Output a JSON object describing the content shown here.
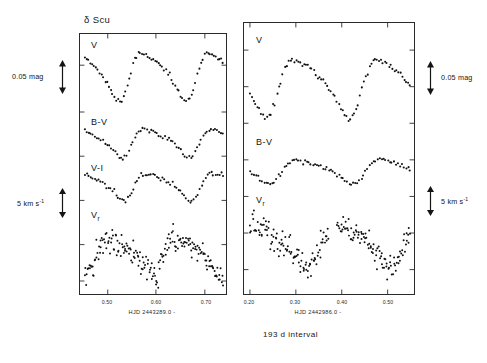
{
  "figure": {
    "star_name": "δ Scu",
    "interval_caption": "193 d  interval",
    "background": "#ffffff",
    "ink": "#141414"
  },
  "scales": {
    "mag_label": "0.05 mag",
    "vel_label_text": "5 km s",
    "vel_label_exponent": "-1",
    "left_mag_bar": {
      "x": 62,
      "y_top": 62,
      "y_bottom": 92
    },
    "left_vel_bar": {
      "x": 62,
      "y_top": 190,
      "y_bottom": 215
    },
    "right_mag_bar": {
      "x": 430,
      "y_top": 63,
      "y_bottom": 93
    },
    "right_vel_bar": {
      "x": 430,
      "y_top": 188,
      "y_bottom": 213
    }
  },
  "left_panel": {
    "name": "left-panel",
    "caption": "HJD 2443289.0 -",
    "x_ticks": [
      {
        "label": "0.50",
        "frac": 0.19
      },
      {
        "label": "0.60",
        "frac": 0.52
      },
      {
        "label": "0.70",
        "frac": 0.855
      }
    ],
    "series_labels": [
      {
        "text": "V",
        "sub": "",
        "x": 11,
        "y": 12
      },
      {
        "text": "B-V",
        "sub": "",
        "x": 11,
        "y": 89
      },
      {
        "text": "V-I",
        "sub": "",
        "x": 11,
        "y": 135
      },
      {
        "text": "V",
        "sub": "r",
        "x": 11,
        "y": 182
      }
    ]
  },
  "right_panel": {
    "name": "right-panel",
    "caption": "HJD 2442986.0 -",
    "x_ticks": [
      {
        "label": "0.20",
        "frac": 0.035
      },
      {
        "label": "0.30",
        "frac": 0.305
      },
      {
        "label": "0.40",
        "frac": 0.575
      },
      {
        "label": "0.50",
        "frac": 0.845
      }
    ],
    "series_labels": [
      {
        "text": "V",
        "sub": "",
        "x": 12,
        "y": 18
      },
      {
        "text": "B-V",
        "sub": "",
        "x": 12,
        "y": 120
      },
      {
        "text": "V",
        "sub": "r",
        "x": 12,
        "y": 178
      }
    ]
  },
  "chart_data": {
    "type": "scatter",
    "title": "δ Scu",
    "panels": [
      {
        "id": "left",
        "xlabel": "HJD 2443289.0 -",
        "xlim": [
          0.44,
          0.74
        ],
        "xticks": [
          0.5,
          0.6,
          0.7
        ],
        "grid": false,
        "legend": "none",
        "series": [
          {
            "name": "V",
            "ylabel": "V magnitude (arbitrary zero, inverted)",
            "scale_bar": "0.05 mag",
            "n_points": 74,
            "phase_min": 0.44,
            "phase_max": 0.74,
            "period_days": 0.1938,
            "amplitude_mag": 0.115,
            "phase_of_max": 0.485,
            "scatter_mag": 0.004,
            "x": [
              0.44,
              0.444,
              0.448,
              0.452,
              0.456,
              0.46,
              0.464,
              0.468,
              0.472,
              0.476,
              0.48,
              0.484,
              0.488,
              0.492,
              0.496,
              0.5,
              0.504,
              0.508,
              0.512,
              0.516,
              0.52,
              0.524,
              0.528,
              0.532,
              0.536,
              0.54,
              0.545,
              0.55,
              0.555,
              0.56,
              0.565,
              0.57,
              0.575,
              0.58,
              0.585,
              0.59,
              0.595,
              0.6,
              0.605,
              0.61,
              0.615,
              0.62,
              0.625,
              0.63,
              0.635,
              0.64,
              0.645,
              0.65,
              0.655,
              0.66,
              0.665,
              0.67,
              0.675,
              0.68,
              0.685,
              0.69,
              0.695,
              0.7,
              0.705,
              0.71,
              0.715,
              0.72,
              0.725,
              0.73,
              0.735,
              0.74
            ],
            "y": [
              0.07,
              0.058,
              0.046,
              0.034,
              0.024,
              0.016,
              0.009,
              0.004,
              0.001,
              0.0,
              0.001,
              0.004,
              0.009,
              0.016,
              0.025,
              0.035,
              0.046,
              0.058,
              0.069,
              0.079,
              0.088,
              0.095,
              0.101,
              0.106,
              0.11,
              0.113,
              0.115,
              0.114,
              0.112,
              0.109,
              0.112,
              0.114,
              0.115,
              0.113,
              0.108,
              0.1,
              0.09,
              0.079,
              0.067,
              0.055,
              0.044,
              0.034,
              0.025,
              0.018,
              0.012,
              0.008,
              0.006,
              0.006,
              0.008,
              0.012,
              0.018,
              0.026,
              0.036,
              0.047,
              0.058,
              0.069,
              0.079,
              0.088,
              0.096,
              0.103,
              0.108,
              0.112,
              0.114,
              0.115,
              0.114,
              0.112
            ]
          },
          {
            "name": "B-V",
            "ylabel": "B-V colour index",
            "scale_bar": "0.05 mag",
            "n_points": 68,
            "amplitude_mag": 0.042,
            "phase_of_max": 0.505,
            "scatter_mag": 0.004
          },
          {
            "name": "V-I",
            "ylabel": "V-I colour index",
            "scale_bar": "0.05 mag",
            "n_points": 70,
            "amplitude_mag": 0.038,
            "phase_of_max": 0.515,
            "scatter_mag": 0.005
          },
          {
            "name": "Vr",
            "ylabel": "Radial velocity",
            "scale_bar": "5 km s-1",
            "n_points": 170,
            "amplitude_kms": 13.0,
            "phase_of_max": 0.575,
            "scatter_kms": 2.2
          }
        ]
      },
      {
        "id": "right",
        "xlabel": "HJD 2442986.0 -",
        "xlim": [
          0.185,
          0.535
        ],
        "xticks": [
          0.2,
          0.3,
          0.4,
          0.5
        ],
        "grid": false,
        "legend": "none",
        "series": [
          {
            "name": "V",
            "ylabel": "V magnitude (arbitrary zero, inverted)",
            "scale_bar": "0.05 mag",
            "n_points": 80,
            "amplitude_mag": 0.122,
            "phase_of_max": 0.335,
            "scatter_mag": 0.004
          },
          {
            "name": "B-V",
            "ylabel": "B-V colour index",
            "scale_bar": "0.05 mag",
            "n_points": 76,
            "amplitude_mag": 0.04,
            "phase_of_max": 0.345,
            "scatter_mag": 0.004
          },
          {
            "name": "Vr",
            "ylabel": "Radial velocity",
            "scale_bar": "5 km s-1",
            "n_points": 200,
            "amplitude_kms": 13.5,
            "phase_of_max": 0.275,
            "scatter_kms": 2.4
          }
        ]
      }
    ]
  }
}
